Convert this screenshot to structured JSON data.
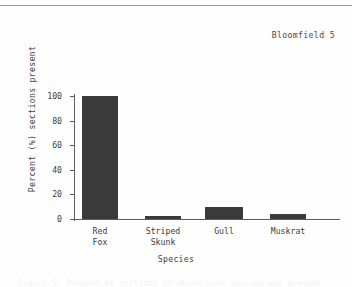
{
  "page": {
    "header_text": "Bloomfield 5",
    "caption_cut_text": "Figure 5. Percent of sections in which each species was present."
  },
  "chart_data": {
    "type": "bar",
    "title": "",
    "categories": [
      "Red Fox",
      "Striped Skunk",
      "Gull",
      "Muskrat"
    ],
    "category_lines": [
      [
        "Red",
        "Fox"
      ],
      [
        "Striped",
        "Skunk"
      ],
      [
        "Gull"
      ],
      [
        "Muskrat"
      ]
    ],
    "values": [
      100,
      2.5,
      10,
      4
    ],
    "xlabel": "Species",
    "ylabel": "Percent (%) sections present",
    "ylim": [
      0,
      100
    ],
    "yticks": [
      0,
      20,
      40,
      60,
      80,
      100
    ],
    "ytick_labels": [
      "0",
      "20",
      "40",
      "60",
      "80",
      "100"
    ],
    "grid": false,
    "legend": false,
    "bar_color": "#3a3a3a",
    "axis_color": "#5d5d5d"
  }
}
